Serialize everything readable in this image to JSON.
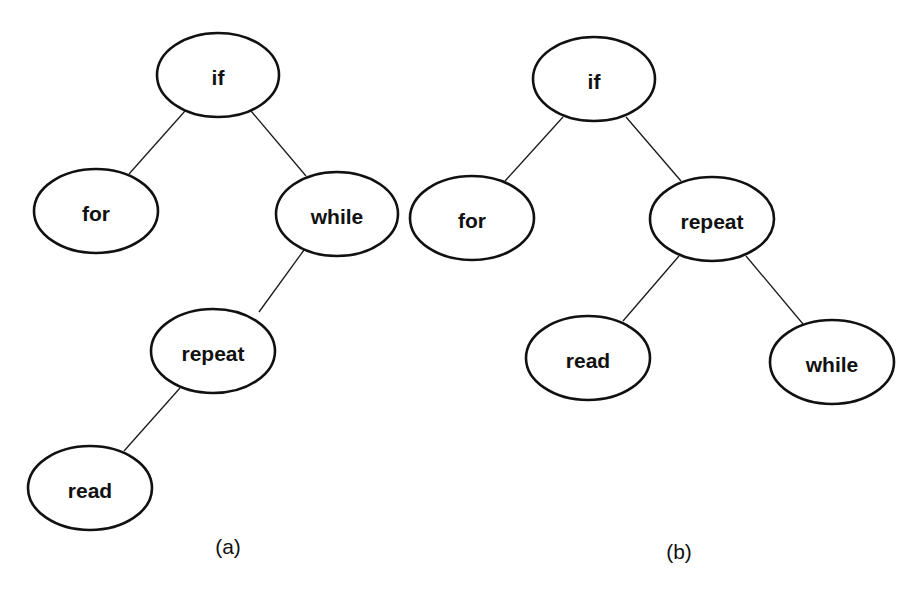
{
  "diagram": {
    "type": "binary-search-tree-comparison",
    "colors": {
      "stroke": "#111111",
      "fill": "#ffffff",
      "text": "#111111"
    },
    "trees": [
      {
        "caption": "(a)",
        "caption_pos": {
          "x": 228,
          "y": 546
        },
        "nodes": [
          {
            "id": "if",
            "label": "if",
            "cx": 218,
            "cy": 75,
            "rx": 61,
            "ry": 42
          },
          {
            "id": "for",
            "label": "for",
            "cx": 96,
            "cy": 211,
            "rx": 62,
            "ry": 42
          },
          {
            "id": "while",
            "label": "while",
            "cx": 337,
            "cy": 214,
            "rx": 61,
            "ry": 42
          },
          {
            "id": "repeat",
            "label": "repeat",
            "cx": 213,
            "cy": 351,
            "rx": 62,
            "ry": 42
          },
          {
            "id": "read",
            "label": "read",
            "cx": 90,
            "cy": 488,
            "rx": 62,
            "ry": 42
          }
        ],
        "edges": [
          {
            "from": "if",
            "to": "for",
            "x1": 185,
            "y1": 111,
            "x2": 129,
            "y2": 174
          },
          {
            "from": "if",
            "to": "while",
            "x1": 251,
            "y1": 111,
            "x2": 306,
            "y2": 176
          },
          {
            "from": "while",
            "to": "repeat",
            "x1": 304,
            "y1": 250,
            "x2": 259,
            "y2": 312
          },
          {
            "from": "repeat",
            "to": "read",
            "x1": 180,
            "y1": 388,
            "x2": 124,
            "y2": 451
          }
        ]
      },
      {
        "caption": "(b)",
        "caption_pos": {
          "x": 679,
          "y": 551
        },
        "nodes": [
          {
            "id": "if",
            "label": "if",
            "cx": 594,
            "cy": 79,
            "rx": 61,
            "ry": 42
          },
          {
            "id": "for",
            "label": "for",
            "cx": 472,
            "cy": 218,
            "rx": 62,
            "ry": 42
          },
          {
            "id": "repeat",
            "label": "repeat",
            "cx": 712,
            "cy": 219,
            "rx": 62,
            "ry": 42
          },
          {
            "id": "read",
            "label": "read",
            "cx": 588,
            "cy": 358,
            "rx": 62,
            "ry": 42
          },
          {
            "id": "while",
            "label": "while",
            "cx": 832,
            "cy": 362,
            "rx": 62,
            "ry": 42
          }
        ],
        "edges": [
          {
            "from": "if",
            "to": "for",
            "x1": 563,
            "y1": 117,
            "x2": 505,
            "y2": 181
          },
          {
            "from": "if",
            "to": "repeat",
            "x1": 626,
            "y1": 117,
            "x2": 681,
            "y2": 181
          },
          {
            "from": "repeat",
            "to": "read",
            "x1": 679,
            "y1": 256,
            "x2": 623,
            "y2": 321
          },
          {
            "from": "repeat",
            "to": "while",
            "x1": 746,
            "y1": 256,
            "x2": 803,
            "y2": 324
          }
        ]
      }
    ]
  }
}
